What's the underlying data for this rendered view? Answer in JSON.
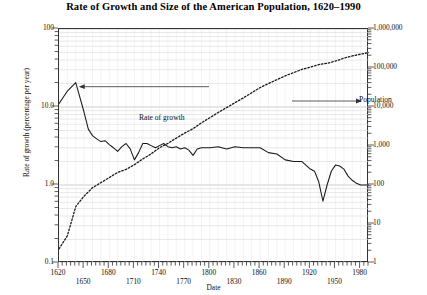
{
  "chart_data": {
    "type": "line",
    "title": "Rate of Growth and Size of the American Population, 1620–1990",
    "xlabel": "Date",
    "ylabel_left": "Rate of growth (percentage per year)",
    "ylabel_right": "Population (thousands)",
    "xlim": [
      1620,
      1990
    ],
    "x_ticks": [
      1620,
      1650,
      1680,
      1710,
      1740,
      1770,
      1800,
      1830,
      1860,
      1890,
      1920,
      1950,
      1980
    ],
    "x_tick_labels": [
      "1620",
      "1650",
      "1680",
      "1710",
      "1740",
      "1770",
      "1800",
      "1830",
      "1860",
      "1890",
      "1920",
      "1950",
      "1980"
    ],
    "y_left_scale": "log",
    "y_left_lim": [
      0.1,
      100
    ],
    "y_left_ticks": [
      0.1,
      1.0,
      10.0,
      100
    ],
    "y_left_tick_labels": [
      "0.1",
      "1.0",
      "10.0",
      "100"
    ],
    "y_right_scale": "log",
    "y_right_lim": [
      1,
      1000000
    ],
    "y_right_ticks": [
      1,
      10,
      100,
      1000,
      10000,
      100000,
      1000000
    ],
    "y_right_tick_labels": [
      "1",
      "10",
      "100",
      "1,000",
      "10,000",
      "100,000",
      "1,000,000"
    ],
    "grid": true,
    "legend": "annotations",
    "annotations": [
      {
        "text": "Rate of growth",
        "arrow": "left",
        "target_series": "rate_of_growth"
      },
      {
        "text": "Population",
        "arrow": "right",
        "target_series": "population"
      }
    ],
    "series": [
      {
        "name": "rate_of_growth",
        "label": "Rate of growth",
        "style": "solid",
        "axis": "left",
        "units": "percentage per year",
        "points": [
          [
            1620,
            11.0
          ],
          [
            1630,
            16.0
          ],
          [
            1640,
            20.5
          ],
          [
            1650,
            8.5
          ],
          [
            1655,
            5.2
          ],
          [
            1660,
            4.3
          ],
          [
            1665,
            3.9
          ],
          [
            1670,
            3.6
          ],
          [
            1675,
            3.7
          ],
          [
            1680,
            3.3
          ],
          [
            1685,
            3.0
          ],
          [
            1690,
            2.7
          ],
          [
            1695,
            3.1
          ],
          [
            1700,
            3.4
          ],
          [
            1705,
            2.9
          ],
          [
            1710,
            2.1
          ],
          [
            1715,
            2.6
          ],
          [
            1720,
            3.4
          ],
          [
            1725,
            3.4
          ],
          [
            1730,
            3.2
          ],
          [
            1735,
            3.0
          ],
          [
            1740,
            3.2
          ],
          [
            1745,
            3.4
          ],
          [
            1750,
            3.1
          ],
          [
            1755,
            3.0
          ],
          [
            1760,
            3.1
          ],
          [
            1765,
            2.9
          ],
          [
            1770,
            3.0
          ],
          [
            1775,
            2.8
          ],
          [
            1780,
            2.4
          ],
          [
            1785,
            2.9
          ],
          [
            1790,
            3.0
          ],
          [
            1800,
            3.0
          ],
          [
            1810,
            3.1
          ],
          [
            1820,
            2.9
          ],
          [
            1830,
            3.1
          ],
          [
            1840,
            3.0
          ],
          [
            1850,
            3.0
          ],
          [
            1860,
            3.0
          ],
          [
            1870,
            2.6
          ],
          [
            1880,
            2.5
          ],
          [
            1890,
            2.1
          ],
          [
            1900,
            2.0
          ],
          [
            1910,
            2.0
          ],
          [
            1920,
            1.6
          ],
          [
            1925,
            1.5
          ],
          [
            1930,
            1.1
          ],
          [
            1935,
            0.62
          ],
          [
            1940,
            1.0
          ],
          [
            1945,
            1.5
          ],
          [
            1950,
            1.8
          ],
          [
            1955,
            1.75
          ],
          [
            1960,
            1.6
          ],
          [
            1965,
            1.3
          ],
          [
            1970,
            1.15
          ],
          [
            1975,
            1.05
          ],
          [
            1980,
            1.0
          ],
          [
            1985,
            1.0
          ],
          [
            1990,
            1.0
          ]
        ]
      },
      {
        "name": "population",
        "label": "Population",
        "style": "dotted",
        "axis": "right",
        "units": "thousands",
        "points": [
          [
            1620,
            2.3
          ],
          [
            1630,
            5
          ],
          [
            1640,
            28
          ],
          [
            1650,
            52
          ],
          [
            1660,
            85
          ],
          [
            1670,
            115
          ],
          [
            1680,
            155
          ],
          [
            1690,
            210
          ],
          [
            1700,
            251
          ],
          [
            1710,
            332
          ],
          [
            1720,
            466
          ],
          [
            1730,
            629
          ],
          [
            1740,
            906
          ],
          [
            1750,
            1171
          ],
          [
            1760,
            1594
          ],
          [
            1770,
            2148
          ],
          [
            1780,
            2780
          ],
          [
            1790,
            3929
          ],
          [
            1800,
            5308
          ],
          [
            1810,
            7240
          ],
          [
            1820,
            9638
          ],
          [
            1830,
            12866
          ],
          [
            1840,
            17069
          ],
          [
            1850,
            23192
          ],
          [
            1860,
            31443
          ],
          [
            1870,
            39818
          ],
          [
            1880,
            50156
          ],
          [
            1890,
            62948
          ],
          [
            1900,
            75995
          ],
          [
            1910,
            91972
          ],
          [
            1920,
            105711
          ],
          [
            1930,
            122775
          ],
          [
            1940,
            131669
          ],
          [
            1950,
            150697
          ],
          [
            1960,
            179323
          ],
          [
            1970,
            203302
          ],
          [
            1980,
            226542
          ],
          [
            1990,
            248710
          ]
        ]
      }
    ]
  },
  "colors": {
    "line": "#1a1a1a",
    "grid": "#d9d9d9",
    "frame": "#333333",
    "text": "#111111"
  }
}
